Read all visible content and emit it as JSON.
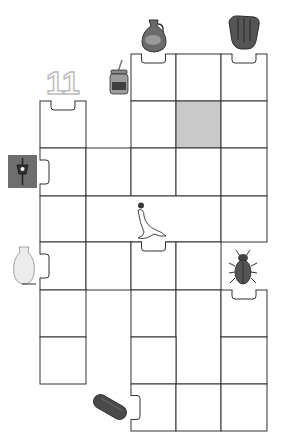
{
  "puzzle": {
    "title": "",
    "grid": {
      "col_edges": [
        40,
        86,
        131,
        176,
        221,
        267
      ],
      "row_edges": [
        54,
        101,
        148,
        196,
        242,
        290,
        337,
        384,
        431
      ],
      "cells": [
        {
          "id": "c-r0-c2",
          "x": 131,
          "y": 54,
          "w": 45,
          "h": 47,
          "fill": "#ffffff",
          "notch": "top"
        },
        {
          "id": "c-r0-c3",
          "x": 176,
          "y": 54,
          "w": 45,
          "h": 47,
          "fill": "#ffffff"
        },
        {
          "id": "c-r0-c4",
          "x": 221,
          "y": 54,
          "w": 46,
          "h": 47,
          "fill": "#ffffff",
          "notch": "top"
        },
        {
          "id": "c-r1-c0",
          "x": 40,
          "y": 101,
          "w": 46,
          "h": 47,
          "fill": "#ffffff",
          "notch": "top"
        },
        {
          "id": "c-r1-c2",
          "x": 131,
          "y": 101,
          "w": 45,
          "h": 47,
          "fill": "#ffffff"
        },
        {
          "id": "c-r1-c3",
          "x": 176,
          "y": 101,
          "w": 45,
          "h": 47,
          "fill": "#c9c9c9"
        },
        {
          "id": "c-r1-c4",
          "x": 221,
          "y": 101,
          "w": 46,
          "h": 47,
          "fill": "#ffffff"
        },
        {
          "id": "c-r2-c0",
          "x": 40,
          "y": 148,
          "w": 46,
          "h": 48,
          "fill": "#ffffff",
          "notch": "left"
        },
        {
          "id": "c-r2-c1",
          "x": 86,
          "y": 148,
          "w": 45,
          "h": 48,
          "fill": "#ffffff"
        },
        {
          "id": "c-r2-c2",
          "x": 131,
          "y": 148,
          "w": 45,
          "h": 48,
          "fill": "#ffffff"
        },
        {
          "id": "c-r2-c3",
          "x": 176,
          "y": 148,
          "w": 45,
          "h": 48,
          "fill": "#ffffff"
        },
        {
          "id": "c-r2-c4",
          "x": 221,
          "y": 148,
          "w": 46,
          "h": 48,
          "fill": "#ffffff"
        },
        {
          "id": "c-r3-c0",
          "x": 40,
          "y": 196,
          "w": 46,
          "h": 46,
          "fill": "#ffffff"
        },
        {
          "id": "c-r3-c1-3",
          "x": 86,
          "y": 196,
          "w": 135,
          "h": 46,
          "fill": "#ffffff"
        },
        {
          "id": "c-r3-c4",
          "x": 221,
          "y": 196,
          "w": 46,
          "h": 46,
          "fill": "#ffffff"
        },
        {
          "id": "c-r4-c0",
          "x": 40,
          "y": 242,
          "w": 46,
          "h": 48,
          "fill": "#ffffff",
          "notch": "left"
        },
        {
          "id": "c-r4-c1",
          "x": 86,
          "y": 242,
          "w": 45,
          "h": 48,
          "fill": "#ffffff"
        },
        {
          "id": "c-r4-c2",
          "x": 131,
          "y": 242,
          "w": 45,
          "h": 48,
          "fill": "#ffffff",
          "notch": "top"
        },
        {
          "id": "c-r4-c3",
          "x": 176,
          "y": 242,
          "w": 45,
          "h": 48,
          "fill": "#ffffff"
        },
        {
          "id": "c-r5-c0",
          "x": 40,
          "y": 290,
          "w": 46,
          "h": 47,
          "fill": "#ffffff"
        },
        {
          "id": "c-r5-c2",
          "x": 131,
          "y": 290,
          "w": 45,
          "h": 47,
          "fill": "#ffffff"
        },
        {
          "id": "c-r5-c3-tall",
          "x": 176,
          "y": 290,
          "w": 45,
          "h": 94,
          "fill": "#ffffff"
        },
        {
          "id": "c-r5-c4",
          "x": 221,
          "y": 290,
          "w": 46,
          "h": 47,
          "fill": "#ffffff",
          "notch": "top"
        },
        {
          "id": "c-r6-c0",
          "x": 40,
          "y": 337,
          "w": 46,
          "h": 47,
          "fill": "#ffffff"
        },
        {
          "id": "c-r6-c2",
          "x": 131,
          "y": 337,
          "w": 45,
          "h": 47,
          "fill": "#ffffff"
        },
        {
          "id": "c-r6-c4",
          "x": 221,
          "y": 337,
          "w": 46,
          "h": 47,
          "fill": "#ffffff"
        },
        {
          "id": "c-r7-c2",
          "x": 131,
          "y": 384,
          "w": 45,
          "h": 47,
          "fill": "#ffffff",
          "notch": "left"
        },
        {
          "id": "c-r7-c3",
          "x": 176,
          "y": 384,
          "w": 45,
          "h": 47,
          "fill": "#ffffff"
        },
        {
          "id": "c-r7-c4",
          "x": 221,
          "y": 384,
          "w": 46,
          "h": 47,
          "fill": "#ffffff"
        }
      ]
    },
    "pictures": [
      {
        "name": "jug-icon",
        "label": "jug",
        "x": 138,
        "y": 18
      },
      {
        "name": "baseball-glove-icon",
        "label": "baseball glove",
        "x": 226,
        "y": 14
      },
      {
        "name": "number-eleven-icon",
        "label": "11",
        "x": 46,
        "y": 66
      },
      {
        "name": "jam-jar-icon",
        "label": "jar",
        "x": 110,
        "y": 60
      },
      {
        "name": "lantern-icon",
        "label": "lantern",
        "x": 8,
        "y": 155
      },
      {
        "name": "seal-with-ball-icon",
        "label": "seal",
        "x": 130,
        "y": 202
      },
      {
        "name": "vase-icon",
        "label": "vase",
        "x": 10,
        "y": 246
      },
      {
        "name": "beetle-icon",
        "label": "beetle",
        "x": 228,
        "y": 248
      },
      {
        "name": "log-icon",
        "label": "log",
        "x": 92,
        "y": 391
      }
    ],
    "colors": {
      "line": "#333333",
      "shaded_cell": "#c9c9c9",
      "lantern_bg": "#6e6e6e",
      "glove": "#5a5a5a",
      "log": "#4a4a4a"
    }
  }
}
